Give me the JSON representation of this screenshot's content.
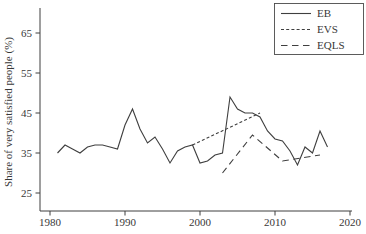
{
  "figure": {
    "background": "#ffffff",
    "line_color": "#3f3f3f",
    "text_color": "#383838"
  },
  "chart_data": {
    "type": "line",
    "title": "",
    "xlabel": "",
    "ylabel": "Share of very satisfied people (%)",
    "x_ticks": [
      1980,
      1990,
      2000,
      2010,
      2020
    ],
    "y_ticks": [
      25,
      35,
      45,
      55,
      65
    ],
    "xlim": [
      1978.7,
      2020.3
    ],
    "ylim": [
      20.5,
      71
    ],
    "grid": false,
    "legend_position": "top-right",
    "series": [
      {
        "name": "EB",
        "style": "solid",
        "x": [
          1981,
          1982,
          1983,
          1984,
          1985,
          1986,
          1987,
          1988,
          1989,
          1990,
          1991,
          1992,
          1993,
          1994,
          1995,
          1996,
          1997,
          1998,
          1999,
          2000,
          2001,
          2002,
          2003,
          2004,
          2005,
          2006,
          2007,
          2008,
          2009,
          2010,
          2011,
          2012,
          2013,
          2014,
          2015,
          2016,
          2017
        ],
        "values": [
          35,
          37,
          36,
          35,
          36.5,
          37,
          37,
          36.5,
          36,
          42,
          46,
          41,
          37.5,
          39,
          36,
          32.5,
          35.5,
          36.5,
          37,
          32.5,
          33,
          34.5,
          35,
          49,
          46,
          45,
          45,
          44,
          40.5,
          38.5,
          38,
          35.5,
          32,
          36.5,
          35,
          40.5,
          36.5
        ]
      },
      {
        "name": "EVS",
        "style": "short-dash",
        "x": [
          1999,
          2008
        ],
        "values": [
          37,
          45
        ]
      },
      {
        "name": "EQLS",
        "style": "long-dash",
        "x": [
          2003,
          2007,
          2011,
          2016
        ],
        "values": [
          30,
          39.5,
          33,
          34.5
        ]
      }
    ]
  },
  "legend": {
    "items": [
      {
        "label": "EB"
      },
      {
        "label": "EVS"
      },
      {
        "label": "EQLS"
      }
    ]
  }
}
